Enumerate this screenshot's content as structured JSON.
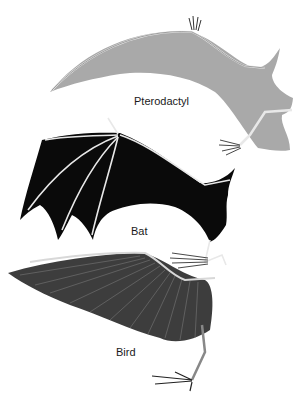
{
  "figure": {
    "labels": {
      "pterodactyl": "Pterodactyl",
      "bat": "Bat",
      "bird": "Bird"
    },
    "colors": {
      "pterodactyl_membrane": "#a9a9a9",
      "bat_membrane": "#0a0a0a",
      "bird_feathers": "#3d3d3d",
      "bone": "#e8e8e8",
      "background": "#ffffff"
    }
  }
}
